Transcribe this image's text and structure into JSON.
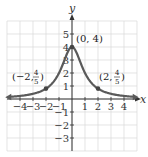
{
  "chart_data": {
    "type": "line",
    "title": "",
    "function": "f(x) = 4/(x^2+1)",
    "xlabel": "x",
    "ylabel": "y",
    "xlim": [
      -5,
      5
    ],
    "ylim": [
      -4,
      6
    ],
    "grid": true,
    "x_ticks": [
      -4,
      -3,
      -2,
      -1,
      1,
      2,
      3,
      4
    ],
    "x_tick_labels": [
      "−4",
      "−3",
      "−2",
      "−1",
      "1",
      "2",
      "3",
      "4"
    ],
    "y_ticks": [
      -3,
      -2,
      -1,
      1,
      2,
      3,
      4,
      5
    ],
    "y_tick_labels": [
      "−3",
      "−2",
      "−1",
      "1",
      "2",
      "3",
      "4",
      "5"
    ],
    "series": [
      {
        "name": "curve",
        "x": [
          -4.8,
          -4,
          -3,
          -2,
          -1,
          -0.5,
          0,
          0.5,
          1,
          2,
          3,
          4,
          4.8
        ],
        "y": [
          0.17,
          0.24,
          0.4,
          0.8,
          2.0,
          3.2,
          4.0,
          3.2,
          2.0,
          0.8,
          0.4,
          0.24,
          0.17
        ],
        "color": "#555555",
        "arrows": "both"
      }
    ],
    "annotations": [
      {
        "x": -2,
        "y": 0.8,
        "label_main": "(−2, ",
        "label_num": "4",
        "label_den": "5",
        "label_close": ")"
      },
      {
        "x": 0,
        "y": 4,
        "label_main": "(0, 4)"
      },
      {
        "x": 2,
        "y": 0.8,
        "label_main": "(2, ",
        "label_num": "4",
        "label_den": "5",
        "label_close": ")"
      }
    ]
  },
  "labels": {
    "x_axis": "x",
    "y_axis": "y",
    "peak": "(0, 4)",
    "left_open": "(−2, ",
    "right_open": "(2, ",
    "frac_num": "4",
    "frac_den": "5",
    "close": ")"
  },
  "colors": {
    "grid": "#d9d9d9",
    "axis": "#333333",
    "curve": "#5a5a5a",
    "point": "#444444"
  }
}
